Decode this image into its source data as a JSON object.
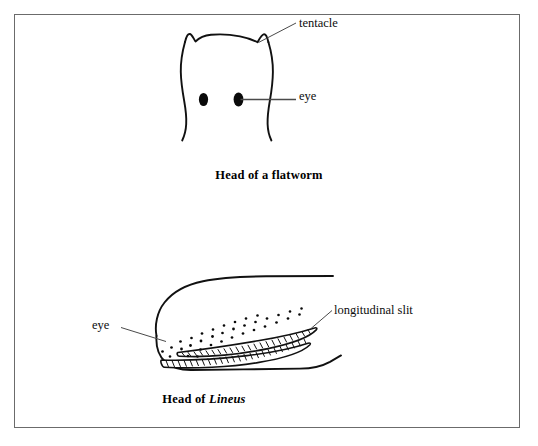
{
  "figure": {
    "background_color": "#ffffff",
    "ink_color": "#000000",
    "frame_color": "#6b6b6b",
    "panels": [
      {
        "id": "flatworm",
        "caption_plain": "Head of a flatworm",
        "caption_prefix": "Head of a flatworm",
        "labels": [
          {
            "id": "tentacle",
            "text": "tentacle"
          },
          {
            "id": "eye",
            "text": "eye"
          }
        ],
        "features": {
          "eye_count": 2,
          "tentacle_count": 2
        }
      },
      {
        "id": "lineus",
        "caption_prefix": "Head of ",
        "caption_scientific": "Lineus",
        "labels": [
          {
            "id": "longitudinal-slit",
            "text": "longitudinal slit"
          },
          {
            "id": "eye",
            "text": "eye"
          }
        ],
        "features": {
          "slit_count": 2,
          "ocelli_description": "scattered dots"
        }
      }
    ]
  }
}
